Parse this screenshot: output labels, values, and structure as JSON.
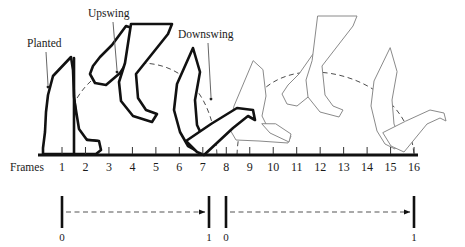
{
  "figure": {
    "background_color": "#ffffff",
    "stroke_dark": "#111111",
    "stroke_light": "#8a8a8a",
    "dash_color": "#4d4d4d"
  },
  "callouts": [
    {
      "id": "planted",
      "label": "Planted",
      "x": 27,
      "y": 47,
      "leader_from": [
        46,
        52
      ],
      "leader_to": [
        48,
        88
      ]
    },
    {
      "id": "upswing",
      "label": "Upswing",
      "x": 88,
      "y": 17,
      "leader_from": [
        113,
        22
      ],
      "leader_to": [
        117,
        73
      ]
    },
    {
      "id": "downswing",
      "label": "Downswing",
      "x": 178,
      "y": 38,
      "leader_from": [
        208,
        43
      ],
      "leader_to": [
        211,
        100
      ]
    }
  ],
  "axis": {
    "frames_label": "Frames",
    "frames_label_x": 10,
    "frames_label_y": 171,
    "baseline_y": 155,
    "baseline_x1": 38,
    "baseline_x2": 418,
    "tick_start_x": 62,
    "tick_spacing": 23.47,
    "tick_height": 7,
    "tick_numbers": [
      "1",
      "2",
      "3",
      "4",
      "5",
      "6",
      "7",
      "8",
      "9",
      "10",
      "11",
      "12",
      "13",
      "14",
      "15",
      "16"
    ]
  },
  "ranges": [
    {
      "id": "cycle-left",
      "start_label": "0",
      "end_label": "1",
      "start_x": 62,
      "end_x": 209,
      "bar_top": 196,
      "bar_bottom": 228,
      "arrow_y": 212,
      "label_y": 241
    },
    {
      "id": "cycle-right",
      "start_label": "0",
      "end_label": "1",
      "start_x": 226,
      "end_x": 414,
      "bar_top": 196,
      "bar_bottom": 228,
      "arrow_y": 212,
      "label_y": 241
    }
  ],
  "chart_data": {
    "type": "diagram",
    "xlabel": "Frames",
    "x_ticks": [
      1,
      2,
      3,
      4,
      5,
      6,
      7,
      8,
      9,
      10,
      11,
      12,
      13,
      14,
      15,
      16
    ],
    "phases": [
      {
        "name": "Planted",
        "frames": [
          1,
          2
        ]
      },
      {
        "name": "Upswing",
        "frames": [
          3,
          4
        ]
      },
      {
        "name": "Downswing",
        "frames": [
          7,
          8
        ]
      }
    ],
    "normalized_cycles": [
      {
        "from_frame": 1,
        "to_frame": 8,
        "from_value": 0,
        "to_value": 1
      },
      {
        "from_frame": 8,
        "to_frame": 16,
        "from_value": 0,
        "to_value": 1
      }
    ],
    "trajectory_arcs": [
      {
        "cycle": 1,
        "start_frame": 1,
        "peak_frame": 4.5,
        "end_frame": 8,
        "style": "dashed"
      },
      {
        "cycle": 2,
        "start_frame": 9,
        "peak_frame": 12.5,
        "end_frame": 16,
        "style": "dashed"
      }
    ],
    "boot_poses": [
      {
        "frame": 1,
        "phase": "planted",
        "emphasis": "bold"
      },
      {
        "frame": 2,
        "phase": "planted",
        "emphasis": "bold"
      },
      {
        "frame": 3,
        "phase": "upswing",
        "emphasis": "bold"
      },
      {
        "frame": 4,
        "phase": "upswing",
        "emphasis": "bold"
      },
      {
        "frame": 7,
        "phase": "downswing",
        "emphasis": "bold"
      },
      {
        "frame": 8,
        "phase": "downswing",
        "emphasis": "bold"
      },
      {
        "frame": 9,
        "phase": "planted",
        "emphasis": "light"
      },
      {
        "frame": 11,
        "phase": "upswing",
        "emphasis": "light"
      },
      {
        "frame": 12,
        "phase": "upswing",
        "emphasis": "light"
      },
      {
        "frame": 15,
        "phase": "downswing",
        "emphasis": "light"
      },
      {
        "frame": 16,
        "phase": "downswing",
        "emphasis": "light"
      }
    ]
  }
}
